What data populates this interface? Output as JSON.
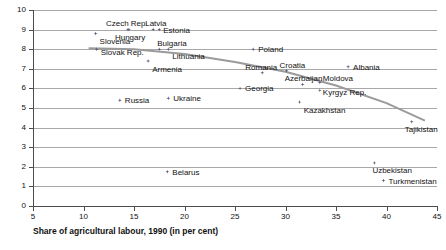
{
  "chart_data": {
    "type": "scatter",
    "title": "",
    "xlabel": "Share of agricultural labour, 1990 (in per cent)",
    "ylabel": "",
    "xlim": [
      5,
      45
    ],
    "ylim": [
      0,
      10
    ],
    "xticks": [
      5,
      10,
      15,
      20,
      25,
      30,
      35,
      40,
      45
    ],
    "yticks": [
      0,
      1,
      2,
      3,
      4,
      5,
      6,
      7,
      8,
      9,
      10
    ],
    "grid": true,
    "legend": "none",
    "points": [
      {
        "label": "Slovenia",
        "x": 11.2,
        "y": 8.8
      },
      {
        "label": "Czech Rep.",
        "x": 14.4,
        "y": 9.0
      },
      {
        "label": "Hungary",
        "x": 14.5,
        "y": 9.0
      },
      {
        "label": "Latvia",
        "x": 16.9,
        "y": 9.0
      },
      {
        "label": "Slovak Rep.",
        "x": 11.3,
        "y": 8.0
      },
      {
        "label": "Estonia",
        "x": 17.5,
        "y": 9.0
      },
      {
        "label": "Bulgaria",
        "x": 17.5,
        "y": 8.0
      },
      {
        "label": "Lithuania",
        "x": 18.4,
        "y": 8.0
      },
      {
        "label": "Armenia",
        "x": 16.4,
        "y": 7.4
      },
      {
        "label": "Poland",
        "x": 26.8,
        "y": 8.0
      },
      {
        "label": "Romania",
        "x": 27.7,
        "y": 6.8
      },
      {
        "label": "Croatia",
        "x": 30.1,
        "y": 6.9
      },
      {
        "label": "Albania",
        "x": 36.2,
        "y": 7.1
      },
      {
        "label": "Azerbaijan",
        "x": 31.7,
        "y": 6.2
      },
      {
        "label": "Moldova",
        "x": 33.4,
        "y": 6.3
      },
      {
        "label": "Kyrgyz Rep.",
        "x": 33.4,
        "y": 5.9
      },
      {
        "label": "Georgia",
        "x": 25.5,
        "y": 6.0
      },
      {
        "label": "Kazakhstan",
        "x": 31.4,
        "y": 5.3
      },
      {
        "label": "Russia",
        "x": 13.6,
        "y": 5.4
      },
      {
        "label": "Ukraine",
        "x": 18.4,
        "y": 5.5
      },
      {
        "label": "Tajikistan",
        "x": 42.5,
        "y": 4.3
      },
      {
        "label": "Uzbekistan",
        "x": 38.8,
        "y": 2.2
      },
      {
        "label": "Turkmenistan",
        "x": 39.7,
        "y": 1.3
      },
      {
        "label": "Belarus",
        "x": 18.3,
        "y": 1.75
      }
    ],
    "trend_curve": [
      {
        "x": 10.5,
        "y": 8.05
      },
      {
        "x": 15.0,
        "y": 8.0
      },
      {
        "x": 20.0,
        "y": 7.75
      },
      {
        "x": 25.0,
        "y": 7.35
      },
      {
        "x": 30.0,
        "y": 6.85
      },
      {
        "x": 35.0,
        "y": 6.15
      },
      {
        "x": 40.0,
        "y": 5.25
      },
      {
        "x": 43.8,
        "y": 4.35
      }
    ],
    "label_offsets": {
      "Slovenia": {
        "dx": 4,
        "dy": 3
      },
      "Czech Rep.": {
        "dx": -22,
        "dy": -11
      },
      "Hungary": {
        "dx": -14,
        "dy": 3
      },
      "Latvia": {
        "dx": -8,
        "dy": -11
      },
      "Slovak Rep.": {
        "dx": 4,
        "dy": -1
      },
      "Estonia": {
        "dx": 4,
        "dy": -4
      },
      "Bulgaria": {
        "dx": -2,
        "dy": -10
      },
      "Lithuania": {
        "dx": 4,
        "dy": 3
      },
      "Armenia": {
        "dx": 4,
        "dy": 4
      },
      "Poland": {
        "dx": 5,
        "dy": -4
      },
      "Romania": {
        "dx": -17,
        "dy": -10
      },
      "Croatia": {
        "dx": -7,
        "dy": -10
      },
      "Albania": {
        "dx": 5,
        "dy": -4
      },
      "Azerbaijan": {
        "dx": -18,
        "dy": -10
      },
      "Moldova": {
        "dx": 3,
        "dy": -9
      },
      "Kyrgyz Rep.": {
        "dx": 3,
        "dy": -2
      },
      "Georgia": {
        "dx": 5,
        "dy": -4
      },
      "Kazakhstan": {
        "dx": 4,
        "dy": 4
      },
      "Russia": {
        "dx": 5,
        "dy": -4
      },
      "Ukraine": {
        "dx": 5,
        "dy": -4
      },
      "Tajikistan": {
        "dx": -7,
        "dy": 3
      },
      "Uzbekistan": {
        "dx": -2,
        "dy": 3
      },
      "Turkmenistan": {
        "dx": 5,
        "dy": -4
      },
      "Belarus": {
        "dx": 5,
        "dy": -4
      }
    }
  }
}
